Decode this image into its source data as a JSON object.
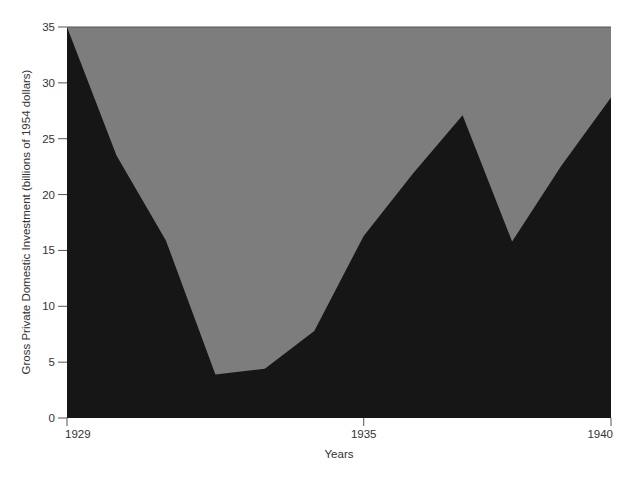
{
  "chart_data": {
    "type": "area",
    "title": "",
    "xlabel": "Years",
    "ylabel": "Gross Private Domestic Investment (billions of 1954 dollars)",
    "x": [
      1929,
      1930,
      1931,
      1932,
      1933,
      1934,
      1935,
      1936,
      1937,
      1938,
      1939,
      1940
    ],
    "series": [
      {
        "name": "Gross Private Domestic Investment",
        "values": [
          35.0,
          23.5,
          15.9,
          3.9,
          4.4,
          7.8,
          16.3,
          21.9,
          27.1,
          15.8,
          22.6,
          28.7
        ]
      }
    ],
    "xlim": [
      1929,
      1940
    ],
    "ylim": [
      0,
      35
    ],
    "x_ticks": [
      "1929",
      "1935",
      "1940"
    ],
    "y_ticks": [
      "0",
      "5",
      "10",
      "15",
      "20",
      "25",
      "30",
      "35"
    ],
    "grid": false,
    "legend": "none",
    "colors": {
      "area_fill": "#161616",
      "background_fill": "#7d7d7d"
    }
  }
}
